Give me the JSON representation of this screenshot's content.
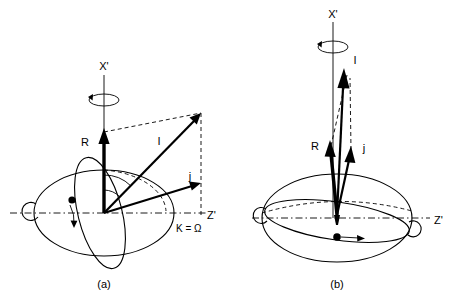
{
  "figure": {
    "title": "",
    "background_color": "#ffffff",
    "ink_color": "#000000",
    "panels": [
      {
        "id": "a",
        "caption": "(a)",
        "description": "Angular momentum vectors for a satellite on a highly inclined orbit",
        "axes": [
          {
            "name": "x-axis-label",
            "label": "X'",
            "orientation": "vertical"
          },
          {
            "name": "z-axis-label",
            "label": "Z'",
            "orientation": "horizontal"
          }
        ],
        "node_label": "K = Ω",
        "vectors": [
          {
            "name": "R",
            "label": "R",
            "style": "bold",
            "direction": "vertical-up"
          },
          {
            "name": "I",
            "label": "I",
            "style": "medium",
            "direction": "diagonal-up-right"
          },
          {
            "name": "j",
            "label": "j",
            "style": "medium",
            "direction": "shallow-up-right"
          }
        ],
        "precession_arrow": "counterclockwise",
        "orbit_body": "satellite-dot",
        "orbit_direction_arrow": "downward"
      },
      {
        "id": "b",
        "caption": "(b)",
        "description": "Angular momentum vectors for a satellite on a near-equatorial orbit",
        "axes": [
          {
            "name": "x-axis-label",
            "label": "X'",
            "orientation": "vertical"
          },
          {
            "name": "z-axis-label",
            "label": "Z'",
            "orientation": "horizontal"
          }
        ],
        "node_label": "",
        "vectors": [
          {
            "name": "R",
            "label": "R",
            "style": "bold",
            "direction": "vertical-up"
          },
          {
            "name": "I",
            "label": "I",
            "style": "medium",
            "direction": "near-vertical-up"
          },
          {
            "name": "j",
            "label": "j",
            "style": "medium",
            "direction": "near-vertical-up"
          }
        ],
        "precession_arrow": "counterclockwise",
        "orbit_body": "satellite-dot",
        "orbit_direction_arrow": "rightward"
      }
    ]
  }
}
